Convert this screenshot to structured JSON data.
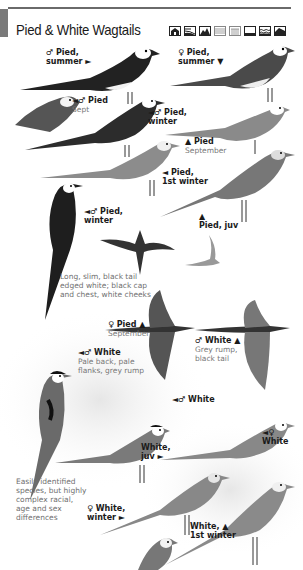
{
  "header": {
    "title": "Pied & White Wagtails",
    "habitat_icons": [
      {
        "name": "urban-habitat-icon"
      },
      {
        "name": "farmland-habitat-icon"
      },
      {
        "name": "mountain-habitat-icon"
      },
      {
        "name": "wetland-habitat-icon"
      },
      {
        "name": "reedbed-habitat-icon"
      },
      {
        "name": "grassland-habitat-icon"
      },
      {
        "name": "freshwater-habitat-icon"
      },
      {
        "name": "coast-habitat-icon"
      }
    ]
  },
  "labels": {
    "m_pied_summer": {
      "line1": "♂ Pied,",
      "line2": "summer ►"
    },
    "f_pied_summer": {
      "line1": "♀ Pied,",
      "line2": "summer ▼"
    },
    "m_pied_sept": {
      "line1": "◄♂ Pied",
      "sub": "Sept"
    },
    "m_pied_winter_top": {
      "line1": "◄♂ Pied,",
      "line2": "winter"
    },
    "pied_september": {
      "line1": "▲ Pied",
      "sub": "September"
    },
    "pied_1st_winter": {
      "line1": "◄ Pied,",
      "line2": "1st winter"
    },
    "m_pied_winter": {
      "line1": "◄♂ Pied,",
      "line2": "winter"
    },
    "pied_juv": {
      "line1": "▲",
      "line2": "Pied, juv"
    },
    "f_pied_flight": {
      "line1": "♀ Pied ▲",
      "sub": "September"
    },
    "m_white_flight": {
      "line1": "♂ White ▲",
      "sub1": "Grey rump,",
      "sub2": "black tail"
    },
    "m_white_perched": {
      "line1": "◄♂ White",
      "sub1": "Pale back, pale",
      "sub2": "flanks, grey rump"
    },
    "m_white": {
      "line1": "◄♂ White"
    },
    "f_white": {
      "line1": "◄♀",
      "line2": "White"
    },
    "white_juv": {
      "line1": "White,",
      "line2": "juv ►"
    },
    "f_white_winter": {
      "line1": "♀ White,",
      "line2": "winter ►"
    },
    "white_1st_winter": {
      "line1": "White, ▲",
      "line2": "1st winter"
    }
  },
  "notes": {
    "tail": [
      "Long, slim, black tail",
      "edged white; black cap",
      "and chest, white cheeks"
    ],
    "species": [
      "Easily identified",
      "species, but highly",
      "complex racial,",
      "age and sex",
      "differences"
    ]
  },
  "colors": {
    "rule": "#6a6a6a",
    "text": "#1a1a1a",
    "subtext": "#777777"
  }
}
